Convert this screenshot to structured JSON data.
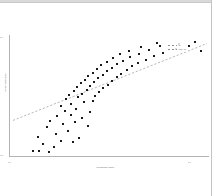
{
  "figure": {
    "title": "",
    "background_color": "#ffffff",
    "point_color": "#1a1a1a",
    "trendline_color": "#9a9a9a",
    "axis_color": "#b3b3b3"
  },
  "legend": {
    "position": "upper right",
    "entries": [
      {
        "label": "fit",
        "style": "dashed"
      },
      {
        "label": "95% CI",
        "style": "dashed"
      }
    ]
  },
  "chart_data": {
    "type": "scatter",
    "title": "",
    "xlabel": "Predicted value",
    "ylabel": "Observed value",
    "xlim": [
      0,
      1
    ],
    "ylim": [
      0,
      1
    ],
    "grid": false,
    "legend_position": "upper right",
    "xticks": [
      "0.0",
      "1.0"
    ],
    "yticks": [
      "1.0",
      "0.0"
    ],
    "marker": "square",
    "marker_size": 2,
    "series": [
      {
        "name": "observations",
        "color": "#1a1a1a",
        "points": [
          [
            0.118,
            0.052
          ],
          [
            0.152,
            0.046
          ],
          [
            0.198,
            0.041
          ],
          [
            0.172,
            0.104
          ],
          [
            0.224,
            0.084
          ],
          [
            0.262,
            0.133
          ],
          [
            0.318,
            0.121
          ],
          [
            0.146,
            0.168
          ],
          [
            0.236,
            0.186
          ],
          [
            0.296,
            0.214
          ],
          [
            0.352,
            0.158
          ],
          [
            0.188,
            0.246
          ],
          [
            0.268,
            0.273
          ],
          [
            0.204,
            0.296
          ],
          [
            0.328,
            0.284
          ],
          [
            0.396,
            0.252
          ],
          [
            0.241,
            0.333
          ],
          [
            0.309,
            0.345
          ],
          [
            0.366,
            0.322
          ],
          [
            0.281,
            0.374
          ],
          [
            0.334,
            0.392
          ],
          [
            0.259,
            0.414
          ],
          [
            0.404,
            0.368
          ],
          [
            0.312,
            0.436
          ],
          [
            0.375,
            0.447
          ],
          [
            0.286,
            0.472
          ],
          [
            0.347,
            0.489
          ],
          [
            0.418,
            0.462
          ],
          [
            0.302,
            0.506
          ],
          [
            0.363,
            0.518
          ],
          [
            0.432,
            0.498
          ],
          [
            0.324,
            0.542
          ],
          [
            0.389,
            0.553
          ],
          [
            0.451,
            0.531
          ],
          [
            0.341,
            0.574
          ],
          [
            0.406,
            0.586
          ],
          [
            0.472,
            0.562
          ],
          [
            0.358,
            0.604
          ],
          [
            0.424,
            0.613
          ],
          [
            0.494,
            0.592
          ],
          [
            0.378,
            0.634
          ],
          [
            0.446,
            0.646
          ],
          [
            0.516,
            0.622
          ],
          [
            0.396,
            0.664
          ],
          [
            0.468,
            0.674
          ],
          [
            0.538,
            0.652
          ],
          [
            0.418,
            0.692
          ],
          [
            0.492,
            0.702
          ],
          [
            0.562,
            0.682
          ],
          [
            0.438,
            0.722
          ],
          [
            0.516,
            0.732
          ],
          [
            0.588,
            0.712
          ],
          [
            0.462,
            0.752
          ],
          [
            0.542,
            0.762
          ],
          [
            0.614,
            0.742
          ],
          [
            0.488,
            0.782
          ],
          [
            0.572,
            0.788
          ],
          [
            0.646,
            0.768
          ],
          [
            0.518,
            0.812
          ],
          [
            0.604,
            0.818
          ],
          [
            0.684,
            0.796
          ],
          [
            0.556,
            0.842
          ],
          [
            0.648,
            0.848
          ],
          [
            0.724,
            0.826
          ],
          [
            0.602,
            0.872
          ],
          [
            0.698,
            0.876
          ],
          [
            0.772,
            0.856
          ],
          [
            0.662,
            0.902
          ],
          [
            0.756,
            0.906
          ],
          [
            0.836,
            0.884
          ],
          [
            0.742,
            0.932
          ],
          [
            0.848,
            0.926
          ],
          [
            0.902,
            0.908
          ],
          [
            0.928,
            0.944
          ],
          [
            0.958,
            0.872
          ]
        ]
      }
    ],
    "trendline": {
      "style": "dashed",
      "color": "#9a9a9a",
      "x_start": 0.02,
      "y_start": 0.3,
      "x_end": 0.99,
      "y_end": 0.93
    }
  }
}
